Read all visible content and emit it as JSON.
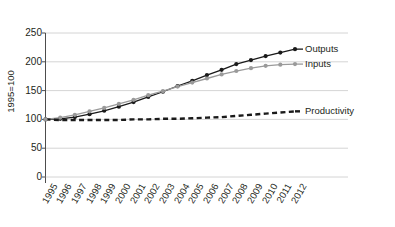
{
  "top_caption": "",
  "chart_data": {
    "type": "line",
    "title": "",
    "xlabel": "",
    "ylabel": "1995=100",
    "ylim": [
      0,
      250
    ],
    "yticks": [
      0,
      50,
      100,
      150,
      200,
      250
    ],
    "grid": true,
    "legend_position": "right-inline",
    "categories": [
      "1995",
      "1996",
      "1997",
      "1998",
      "1999",
      "2000",
      "2001",
      "2002",
      "2003",
      "2004",
      "2005",
      "2006",
      "2007",
      "2008",
      "2009",
      "2010",
      "2011",
      "2012"
    ],
    "series": [
      {
        "name": "Outputs",
        "color": "#1a1a1a",
        "style": "solid-markers",
        "values": [
          100,
          101,
          104,
          109,
          115,
          122,
          130,
          139,
          148,
          158,
          167,
          177,
          186,
          196,
          203,
          210,
          216,
          222
        ]
      },
      {
        "name": "Inputs",
        "color": "#9a9a9a",
        "style": "solid-markers",
        "values": [
          100,
          103,
          108,
          114,
          120,
          127,
          134,
          142,
          149,
          157,
          164,
          171,
          178,
          184,
          189,
          193,
          195,
          196
        ]
      },
      {
        "name": "Productivity",
        "color": "#1a1a1a",
        "style": "dashed",
        "values": [
          100,
          99,
          99,
          99,
          99,
          99,
          100,
          100,
          101,
          101,
          102,
          103,
          104,
          106,
          108,
          110,
          112,
          114
        ]
      }
    ]
  },
  "series_labels": {
    "outputs": "Outputs",
    "inputs": "Inputs",
    "productivity": "Productivity"
  }
}
